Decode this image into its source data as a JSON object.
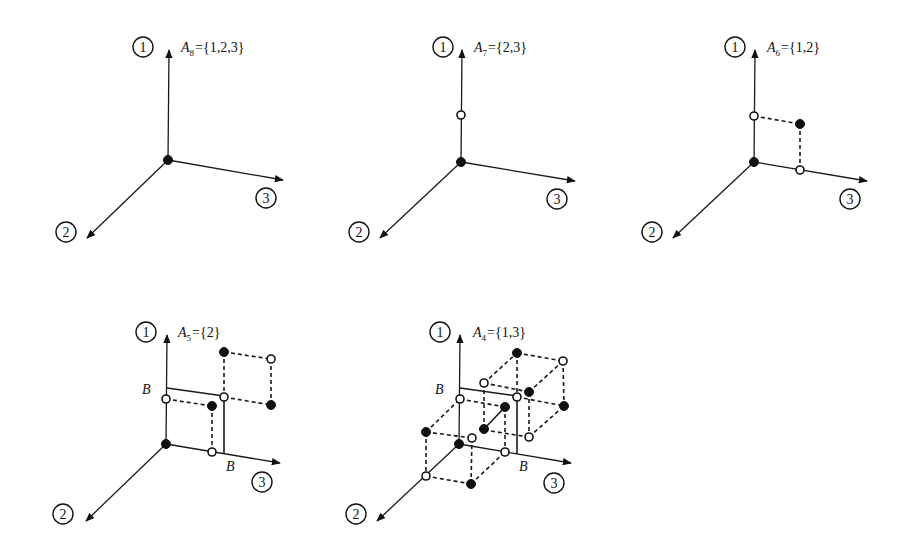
{
  "figure": {
    "panels": [
      {
        "id": "A8",
        "label_letter": "A",
        "label_sub": "8",
        "label_set": "={1,2,3}",
        "axes": [
          "1",
          "2",
          "3"
        ],
        "boundary_label": ""
      },
      {
        "id": "A7",
        "label_letter": "A",
        "label_sub": "7",
        "label_set": "={2,3}",
        "axes": [
          "1",
          "2",
          "3"
        ],
        "boundary_label": ""
      },
      {
        "id": "A6",
        "label_letter": "A",
        "label_sub": "6",
        "label_set": "={1,2}",
        "axes": [
          "1",
          "2",
          "3"
        ],
        "boundary_label": ""
      },
      {
        "id": "A5",
        "label_letter": "A",
        "label_sub": "5",
        "label_set": "={2}",
        "axes": [
          "1",
          "2",
          "3"
        ],
        "boundary_label": "B"
      },
      {
        "id": "A4",
        "label_letter": "A",
        "label_sub": "4",
        "label_set": "={1,3}",
        "axes": [
          "1",
          "2",
          "3"
        ],
        "boundary_label": "B"
      }
    ],
    "colors": {
      "ink": "#111111",
      "background": "#ffffff"
    },
    "legend": {
      "filled_point": "filled-circle",
      "open_point": "open-circle"
    }
  }
}
